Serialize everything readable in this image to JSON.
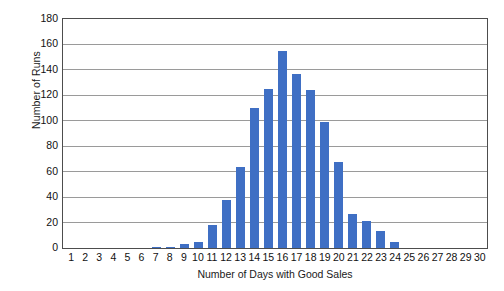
{
  "chart_data": {
    "type": "bar",
    "title": "",
    "xlabel": "Number of Days with Good Sales",
    "ylabel": "Number of Runs",
    "categories": [
      "1",
      "2",
      "3",
      "4",
      "5",
      "6",
      "7",
      "8",
      "9",
      "10",
      "11",
      "12",
      "13",
      "14",
      "15",
      "16",
      "17",
      "18",
      "19",
      "20",
      "21",
      "22",
      "23",
      "24",
      "25",
      "26",
      "27",
      "28",
      "29",
      "30"
    ],
    "values": [
      0,
      0,
      0,
      0,
      0,
      0,
      1,
      1,
      3,
      5,
      18,
      38,
      64,
      110,
      125,
      155,
      137,
      124,
      99,
      68,
      27,
      21,
      13,
      5,
      0,
      0,
      0,
      0,
      0,
      0
    ],
    "ylim": [
      0,
      180
    ],
    "ytick_labels": [
      "0",
      "20",
      "40",
      "60",
      "80",
      "100",
      "120",
      "140",
      "160",
      "180"
    ],
    "ytick_values": [
      0,
      20,
      40,
      60,
      80,
      100,
      120,
      140,
      160,
      180
    ],
    "grid": true,
    "legend": false,
    "bar_color": "#3f6fc4",
    "gridline_color": "#9a9a9a",
    "axis_color": "#4d4d4d",
    "background_color": "#ffffff"
  }
}
